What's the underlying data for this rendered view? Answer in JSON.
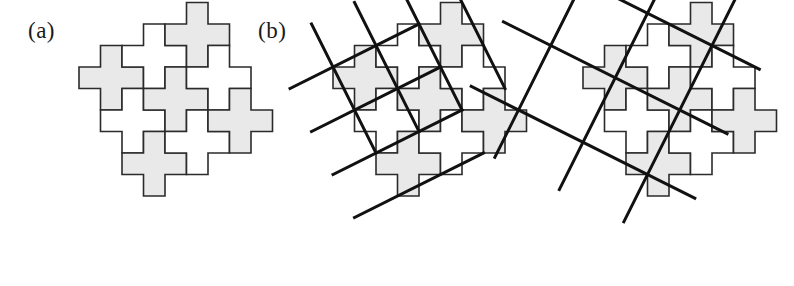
{
  "figure": {
    "caption_kind": "tiling-figure",
    "background_color": "#ffffff",
    "tile_fill_shaded": "#e9e9e9",
    "tile_fill_plain": "#ffffff",
    "tile_stroke": "#2b2b2b",
    "lattice_stroke": "#111111",
    "tile_stroke_width": 1.6,
    "lattice_stroke_width": 3.0,
    "cell_size": 21.5
  },
  "panels": [
    {
      "id": "panel-a",
      "label": "(a)",
      "label_x": 28,
      "label_y": 18,
      "origin_x": 36,
      "origin_y": 24,
      "show_lattice": false,
      "lattice_kind": "none",
      "lattice_u": [
        1,
        2
      ],
      "lattice_v": [
        2,
        -1
      ]
    },
    {
      "id": "panel-b",
      "label": "(b)",
      "label_x": 258,
      "label_y": 18,
      "origin_x": 290,
      "origin_y": 24,
      "show_lattice": true,
      "lattice_kind": "parallelogram-grid",
      "lattice_u": [
        1,
        2
      ],
      "lattice_v": [
        2,
        -1
      ]
    },
    {
      "id": "panel-c",
      "label": "",
      "label_x": 0,
      "label_y": 0,
      "origin_x": 540,
      "origin_y": 24,
      "show_lattice": true,
      "lattice_kind": "shear-grid",
      "lattice_u": [
        1,
        2
      ],
      "lattice_v": [
        2,
        -1
      ]
    }
  ],
  "tiling": {
    "description": "plus-pentomino (Greek cross) tiling of the plane",
    "tile_cells": [
      [
        1,
        0
      ],
      [
        0,
        1
      ],
      [
        1,
        1
      ],
      [
        2,
        1
      ],
      [
        1,
        2
      ]
    ],
    "tile_width_cells": 3,
    "tile_height_cells": 3,
    "centers": [
      {
        "i": 0,
        "j": 0,
        "shaded": true
      },
      {
        "i": 1,
        "j": 0,
        "shaded": false
      },
      {
        "i": 2,
        "j": 0,
        "shaded": true
      },
      {
        "i": 0,
        "j": 1,
        "shaded": false
      },
      {
        "i": 1,
        "j": 1,
        "shaded": true
      },
      {
        "i": 2,
        "j": 1,
        "shaded": false
      },
      {
        "i": 0,
        "j": 2,
        "shaded": true
      },
      {
        "i": 1,
        "j": 2,
        "shaded": false
      },
      {
        "i": 2,
        "j": 2,
        "shaded": true
      }
    ],
    "grid_rows": 3,
    "grid_cols": 3
  },
  "lattice_lines": {
    "panel_b": {
      "direction_1": [
        2,
        -1
      ],
      "direction_2": [
        1,
        2
      ],
      "count_1": 4,
      "count_2": 4
    },
    "panel_c": {
      "direction_1": [
        2,
        1
      ],
      "direction_2": [
        -1,
        2
      ],
      "count_1": 3,
      "count_2": 3
    }
  }
}
